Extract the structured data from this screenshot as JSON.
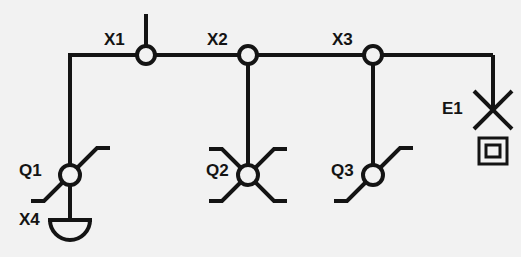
{
  "diagram": {
    "type": "single-line-wiring-diagram",
    "background_color": "#f2f2f2",
    "line_color": "#141414",
    "labels": {
      "x1": "X1",
      "x2": "X2",
      "x3": "X3",
      "x4": "X4",
      "q1": "Q1",
      "q2": "Q2",
      "q3": "Q3",
      "e1": "E1"
    },
    "nodes": [
      {
        "id": "X1",
        "label": "X1",
        "kind": "junction-box",
        "x": 146,
        "y": 55,
        "stub": "up"
      },
      {
        "id": "X2",
        "label": "X2",
        "kind": "junction-box",
        "x": 248,
        "y": 55,
        "stub": "down"
      },
      {
        "id": "X3",
        "label": "X3",
        "kind": "junction-box",
        "x": 373,
        "y": 55,
        "stub": "down"
      },
      {
        "id": "X4",
        "label": "X4",
        "kind": "socket-outlet",
        "x": 70,
        "y": 220
      },
      {
        "id": "Q1",
        "label": "Q1",
        "kind": "switch-two-way",
        "x": 70,
        "y": 175,
        "arms": 2
      },
      {
        "id": "Q2",
        "label": "Q2",
        "kind": "switch-four-way",
        "x": 248,
        "y": 175,
        "arms": 4
      },
      {
        "id": "Q3",
        "label": "Q3",
        "kind": "switch-two-way",
        "x": 373,
        "y": 175,
        "arms": 2
      },
      {
        "id": "E1",
        "label": "E1",
        "kind": "luminaire-lamp",
        "x": 493,
        "y": 110
      }
    ],
    "bus": {
      "y": 55,
      "x_start": 68,
      "x_end": 493
    },
    "connections": [
      {
        "from": "bus-left-corner",
        "to": "Q1"
      },
      {
        "from": "Q1",
        "to": "X4"
      },
      {
        "from": "X1",
        "to": "bus"
      },
      {
        "from": "X2",
        "to": "Q2"
      },
      {
        "from": "X3",
        "to": "Q3"
      },
      {
        "from": "bus-right-corner",
        "to": "E1"
      }
    ]
  }
}
